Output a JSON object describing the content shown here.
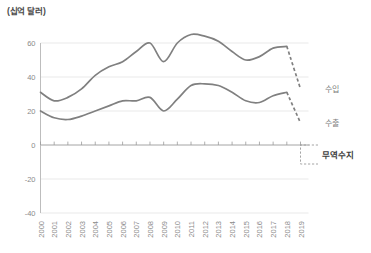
{
  "chart_data": {
    "type": "line",
    "title": "(십억 달러)",
    "xlabel": "",
    "ylabel": "(십억 달러)",
    "ylim": [
      -40,
      60
    ],
    "yticks": [
      60,
      40,
      20,
      0,
      -20,
      -40
    ],
    "grid": true,
    "legend_position": "right",
    "x": [
      2000,
      2001,
      2002,
      2003,
      2004,
      2005,
      2006,
      2007,
      2008,
      2009,
      2010,
      2011,
      2012,
      2013,
      2014,
      2015,
      2016,
      2017,
      2018,
      2019
    ],
    "categories": [
      "2000",
      "2001",
      "2002",
      "2003",
      "2004",
      "2005",
      "2006",
      "2007",
      "2008",
      "2009",
      "2010",
      "2011",
      "2012",
      "2013",
      "2014",
      "2015",
      "2016",
      "2017",
      "2018",
      "2019"
    ],
    "series": [
      {
        "name": "수입",
        "label": "수입",
        "values": [
          31,
          26,
          28,
          33,
          41,
          46,
          49,
          55,
          60,
          49,
          60,
          65,
          64,
          61,
          55,
          50,
          52,
          57,
          58,
          33
        ],
        "dashed_from": 2018,
        "color": "#808080"
      },
      {
        "name": "수출",
        "label": "수출",
        "values": [
          20,
          16,
          15,
          17,
          20,
          23,
          26,
          26,
          28,
          20,
          27,
          35,
          36,
          35,
          31,
          26,
          25,
          29,
          31,
          13
        ],
        "dashed_from": 2018,
        "color": "#808080"
      }
    ],
    "annotations": [
      {
        "name": "무역수지",
        "label": "무역수지",
        "type": "bracket",
        "description": "trade balance bracket near zero line at right edge"
      }
    ]
  },
  "labels": {
    "unit_title": "(십억 달러)",
    "import_label": "수입",
    "export_label": "수출",
    "balance_label": "무역수지"
  },
  "colors": {
    "line": "#808080",
    "grid": "#e3e3e3",
    "axis": "#b5b5b5",
    "text": "#8a8a8a"
  }
}
